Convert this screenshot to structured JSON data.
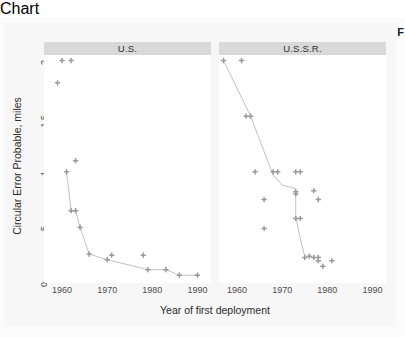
{
  "chart_data": {
    "type": "scatter",
    "title": "",
    "xlabel": "Year of first deployment",
    "ylabel": "Circular Error Probable, miles",
    "xlim": [
      1956,
      1993
    ],
    "ylim": [
      0,
      2.05
    ],
    "xticks": [
      1960,
      1970,
      1980,
      1990
    ],
    "xticklabels": [
      "1960",
      "1970",
      "1980",
      "1990"
    ],
    "yticks": [
      0,
      0.5,
      1,
      1.5,
      2
    ],
    "yticklabels": [
      "0",
      ".5",
      "1",
      "1.5",
      "2"
    ],
    "grid": false,
    "legend": "none",
    "facet_layout": "1 row x 2 columns",
    "point_color": "#9a9a9a",
    "line_color": "#b9b9b9",
    "strip_background": "#d9d9d9",
    "panel_background": "#ffffff",
    "figure_background": "#f7f7f7",
    "panels": [
      {
        "label": "U.S.",
        "points": [
          {
            "x": 1960,
            "y": 2.0
          },
          {
            "x": 1962,
            "y": 2.0
          },
          {
            "x": 1959,
            "y": 1.8
          },
          {
            "x": 1963,
            "y": 1.1
          },
          {
            "x": 1961,
            "y": 1.0
          },
          {
            "x": 1962,
            "y": 0.65
          },
          {
            "x": 1963,
            "y": 0.65
          },
          {
            "x": 1964,
            "y": 0.5
          },
          {
            "x": 1966,
            "y": 0.26
          },
          {
            "x": 1970,
            "y": 0.21
          },
          {
            "x": 1971,
            "y": 0.25
          },
          {
            "x": 1978,
            "y": 0.25
          },
          {
            "x": 1979,
            "y": 0.12
          },
          {
            "x": 1983,
            "y": 0.12
          },
          {
            "x": 1986,
            "y": 0.07
          },
          {
            "x": 1990,
            "y": 0.07
          }
        ],
        "trend_line": [
          {
            "x": 1961,
            "y": 1.0
          },
          {
            "x": 1962,
            "y": 0.65
          },
          {
            "x": 1963,
            "y": 0.65
          },
          {
            "x": 1964,
            "y": 0.5
          },
          {
            "x": 1966,
            "y": 0.26
          },
          {
            "x": 1970,
            "y": 0.21
          },
          {
            "x": 1979,
            "y": 0.12
          },
          {
            "x": 1983,
            "y": 0.12
          },
          {
            "x": 1986,
            "y": 0.07
          },
          {
            "x": 1990,
            "y": 0.07
          }
        ]
      },
      {
        "label": "U.S.S.R.",
        "points": [
          {
            "x": 1957,
            "y": 2.0
          },
          {
            "x": 1961,
            "y": 2.0
          },
          {
            "x": 1962,
            "y": 1.5
          },
          {
            "x": 1963,
            "y": 1.5
          },
          {
            "x": 1964,
            "y": 1.0
          },
          {
            "x": 1968,
            "y": 1.0
          },
          {
            "x": 1969,
            "y": 1.0
          },
          {
            "x": 1973,
            "y": 1.0
          },
          {
            "x": 1974,
            "y": 1.0
          },
          {
            "x": 1966,
            "y": 0.75
          },
          {
            "x": 1973,
            "y": 0.82
          },
          {
            "x": 1973,
            "y": 0.8
          },
          {
            "x": 1977,
            "y": 0.83
          },
          {
            "x": 1978,
            "y": 0.75
          },
          {
            "x": 1973,
            "y": 0.58
          },
          {
            "x": 1974,
            "y": 0.58
          },
          {
            "x": 1966,
            "y": 0.49
          },
          {
            "x": 1975,
            "y": 0.23
          },
          {
            "x": 1976,
            "y": 0.24
          },
          {
            "x": 1977,
            "y": 0.23
          },
          {
            "x": 1978,
            "y": 0.23
          },
          {
            "x": 1978,
            "y": 0.2
          },
          {
            "x": 1979,
            "y": 0.15
          },
          {
            "x": 1981,
            "y": 0.2
          }
        ],
        "trend_line": [
          {
            "x": 1957,
            "y": 2.0
          },
          {
            "x": 1963,
            "y": 1.5
          },
          {
            "x": 1968,
            "y": 0.97
          },
          {
            "x": 1970,
            "y": 0.88
          },
          {
            "x": 1973,
            "y": 0.85
          },
          {
            "x": 1973,
            "y": 0.6
          },
          {
            "x": 1974,
            "y": 0.4
          },
          {
            "x": 1975,
            "y": 0.24
          }
        ]
      }
    ]
  },
  "corner_mark": "F"
}
